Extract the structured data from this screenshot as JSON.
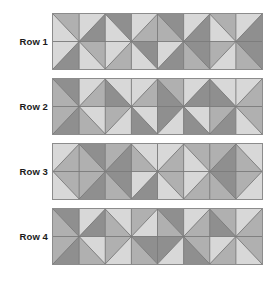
{
  "page": {
    "background_color": "#ffffff"
  },
  "palette": {
    "light": "#d8d8d8",
    "medium": "#b0b0b0",
    "dark": "#8f8f8f",
    "grid_line": "#7a7a7a",
    "panel_border": "#8c8c8c",
    "label_color": "#1b1b1b"
  },
  "grid": {
    "columns": 8,
    "subrows": 2,
    "cell_width": 26.375,
    "cell_height": 27.5
  },
  "rows": [
    {
      "label": "Row 1",
      "top": 13,
      "label_top": 37,
      "cells": [
        [
          {
            "diag": "tlbr",
            "a": "medium",
            "b": "light"
          },
          {
            "diag": "trbl",
            "a": "light",
            "b": "dark"
          },
          {
            "diag": "tlbr",
            "a": "dark",
            "b": "light"
          },
          {
            "diag": "trbl",
            "a": "light",
            "b": "medium"
          },
          {
            "diag": "tlbr",
            "a": "dark",
            "b": "medium"
          },
          {
            "diag": "trbl",
            "a": "light",
            "b": "dark"
          },
          {
            "diag": "tlbr",
            "a": "medium",
            "b": "light"
          },
          {
            "diag": "trbl",
            "a": "light",
            "b": "dark"
          }
        ],
        [
          {
            "diag": "trbl",
            "a": "light",
            "b": "dark"
          },
          {
            "diag": "tlbr",
            "a": "medium",
            "b": "light"
          },
          {
            "diag": "trbl",
            "a": "light",
            "b": "medium"
          },
          {
            "diag": "tlbr",
            "a": "dark",
            "b": "light"
          },
          {
            "diag": "trbl",
            "a": "light",
            "b": "dark"
          },
          {
            "diag": "tlbr",
            "a": "dark",
            "b": "medium"
          },
          {
            "diag": "trbl",
            "a": "medium",
            "b": "light"
          },
          {
            "diag": "tlbr",
            "a": "dark",
            "b": "medium"
          }
        ]
      ]
    },
    {
      "label": "Row 2",
      "top": 78,
      "label_top": 102,
      "cells": [
        [
          {
            "diag": "tlbr",
            "a": "dark",
            "b": "medium"
          },
          {
            "diag": "trbl",
            "a": "light",
            "b": "medium"
          },
          {
            "diag": "tlbr",
            "a": "light",
            "b": "dark"
          },
          {
            "diag": "trbl",
            "a": "light",
            "b": "medium"
          },
          {
            "diag": "tlbr",
            "a": "medium",
            "b": "dark"
          },
          {
            "diag": "trbl",
            "a": "light",
            "b": "dark"
          },
          {
            "diag": "tlbr",
            "a": "light",
            "b": "dark"
          },
          {
            "diag": "trbl",
            "a": "light",
            "b": "medium"
          }
        ],
        [
          {
            "diag": "trbl",
            "a": "medium",
            "b": "dark"
          },
          {
            "diag": "tlbr",
            "a": "light",
            "b": "medium"
          },
          {
            "diag": "trbl",
            "a": "medium",
            "b": "light"
          },
          {
            "diag": "tlbr",
            "a": "light",
            "b": "dark"
          },
          {
            "diag": "trbl",
            "a": "dark",
            "b": "light"
          },
          {
            "diag": "tlbr",
            "a": "light",
            "b": "dark"
          },
          {
            "diag": "trbl",
            "a": "medium",
            "b": "dark"
          },
          {
            "diag": "tlbr",
            "a": "medium",
            "b": "light"
          }
        ]
      ]
    },
    {
      "label": "Row 3",
      "top": 143,
      "label_top": 167,
      "cells": [
        [
          {
            "diag": "trbl",
            "a": "light",
            "b": "medium"
          },
          {
            "diag": "tlbr",
            "a": "dark",
            "b": "medium"
          },
          {
            "diag": "trbl",
            "a": "medium",
            "b": "dark"
          },
          {
            "diag": "tlbr",
            "a": "light",
            "b": "medium"
          },
          {
            "diag": "trbl",
            "a": "light",
            "b": "medium"
          },
          {
            "diag": "tlbr",
            "a": "medium",
            "b": "light"
          },
          {
            "diag": "trbl",
            "a": "medium",
            "b": "dark"
          },
          {
            "diag": "tlbr",
            "a": "light",
            "b": "medium"
          }
        ],
        [
          {
            "diag": "tlbr",
            "a": "medium",
            "b": "light"
          },
          {
            "diag": "trbl",
            "a": "medium",
            "b": "dark"
          },
          {
            "diag": "tlbr",
            "a": "dark",
            "b": "medium"
          },
          {
            "diag": "trbl",
            "a": "light",
            "b": "dark"
          },
          {
            "diag": "tlbr",
            "a": "medium",
            "b": "light"
          },
          {
            "diag": "trbl",
            "a": "light",
            "b": "medium"
          },
          {
            "diag": "tlbr",
            "a": "dark",
            "b": "medium"
          },
          {
            "diag": "trbl",
            "a": "medium",
            "b": "light"
          }
        ]
      ]
    },
    {
      "label": "Row 4",
      "top": 208,
      "label_top": 232,
      "cells": [
        [
          {
            "diag": "tlbr",
            "a": "dark",
            "b": "medium"
          },
          {
            "diag": "trbl",
            "a": "light",
            "b": "dark"
          },
          {
            "diag": "tlbr",
            "a": "light",
            "b": "medium"
          },
          {
            "diag": "trbl",
            "a": "medium",
            "b": "light"
          },
          {
            "diag": "tlbr",
            "a": "dark",
            "b": "medium"
          },
          {
            "diag": "trbl",
            "a": "light",
            "b": "medium"
          },
          {
            "diag": "tlbr",
            "a": "medium",
            "b": "dark"
          },
          {
            "diag": "trbl",
            "a": "light",
            "b": "medium"
          }
        ],
        [
          {
            "diag": "trbl",
            "a": "medium",
            "b": "dark"
          },
          {
            "diag": "tlbr",
            "a": "light",
            "b": "medium"
          },
          {
            "diag": "trbl",
            "a": "medium",
            "b": "light"
          },
          {
            "diag": "tlbr",
            "a": "dark",
            "b": "medium"
          },
          {
            "diag": "trbl",
            "a": "dark",
            "b": "light"
          },
          {
            "diag": "tlbr",
            "a": "medium",
            "b": "dark"
          },
          {
            "diag": "trbl",
            "a": "light",
            "b": "medium"
          },
          {
            "diag": "tlbr",
            "a": "medium",
            "b": "light"
          }
        ]
      ]
    }
  ]
}
